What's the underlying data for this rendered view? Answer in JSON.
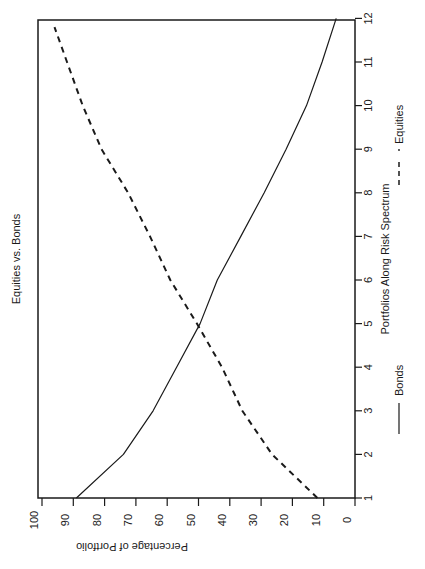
{
  "chart_data": {
    "type": "line",
    "title": "Equities vs. Bonds",
    "xlabel": "Portfolios Along Risk Spectrum",
    "ylabel": "Percentage of Portfolio",
    "x": [
      1,
      2,
      3,
      4,
      5,
      6,
      7,
      8,
      9,
      10,
      11,
      12
    ],
    "xlim": [
      1,
      12
    ],
    "ylim": [
      0,
      100
    ],
    "x_ticks": [
      "1",
      "2",
      "3",
      "4",
      "5",
      "6",
      "7",
      "8",
      "9",
      "10",
      "11",
      "12"
    ],
    "y_ticks": [
      "0",
      "10",
      "20",
      "30",
      "40",
      "50",
      "60",
      "70",
      "80",
      "90",
      "100"
    ],
    "grid": false,
    "legend_position": "bottom",
    "orientation": "rotated 90 degrees counter-clockwise",
    "series": [
      {
        "name": "Bonds",
        "style": "solid",
        "x": [
          1,
          2,
          3,
          4,
          5,
          6,
          7,
          8,
          9,
          10,
          11,
          12
        ],
        "values": [
          89,
          74,
          64.5,
          57,
          49.5,
          44,
          36.5,
          29,
          22,
          15.5,
          10.5,
          6
        ]
      },
      {
        "name": "Equities",
        "style": "dashed",
        "x": [
          1,
          2,
          3,
          4,
          5,
          6,
          7,
          8,
          9,
          10,
          11,
          11.8
        ],
        "values": [
          12,
          26.5,
          36,
          42.5,
          50.5,
          59,
          65.5,
          72.5,
          81,
          87,
          92,
          96
        ]
      }
    ]
  },
  "legend": {
    "bonds_label": "Bonds",
    "equities_label": "Equities"
  },
  "colors": {
    "line": "#1a1a1a",
    "background": "#ffffff"
  }
}
